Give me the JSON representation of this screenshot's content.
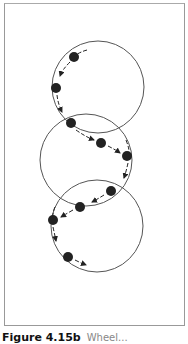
{
  "figure": {
    "caption_label": "Figure 4.15b",
    "caption_text": "Wheel..."
  },
  "diagram": {
    "circles": [
      {
        "cx": 98,
        "cy": 87,
        "r": 46
      },
      {
        "cx": 86,
        "cy": 160,
        "r": 46
      },
      {
        "cx": 97,
        "cy": 226,
        "r": 46
      }
    ],
    "dots": [
      {
        "x": 74,
        "y": 57
      },
      {
        "x": 56,
        "y": 88
      },
      {
        "x": 71,
        "y": 123
      },
      {
        "x": 101,
        "y": 143
      },
      {
        "x": 127,
        "y": 156
      },
      {
        "x": 111,
        "y": 191
      },
      {
        "x": 80,
        "y": 207
      },
      {
        "x": 53,
        "y": 220
      },
      {
        "x": 68,
        "y": 257
      }
    ],
    "colors": {
      "circle": "#555555",
      "dot": "#222222",
      "frame": "#999999"
    }
  }
}
